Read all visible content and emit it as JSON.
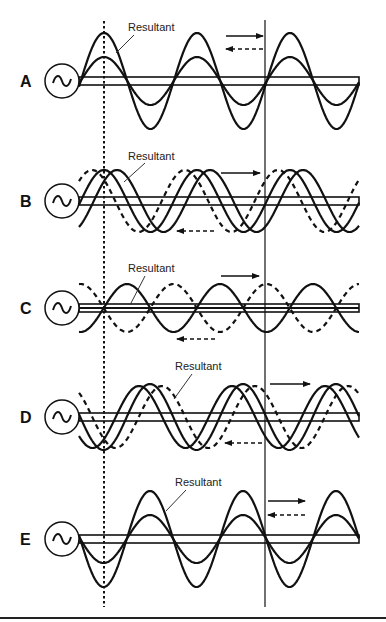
{
  "figure": {
    "width": 386,
    "height": 622,
    "line_color": "#111111",
    "background": "#ffffff",
    "reference_lines": {
      "dotted": {
        "x": 104,
        "y1": 21,
        "y2": 607
      },
      "solid": {
        "x": 265,
        "y1": 20,
        "y2": 607
      }
    },
    "bottom_rule": {
      "y": 618,
      "x1": 0,
      "x2": 386
    },
    "wavelength": 93,
    "conductor": {
      "x_start": 79,
      "x_end": 359
    },
    "panels": [
      {
        "id": "A",
        "letter": "A",
        "center_y": 81,
        "source": {
          "cx": 62,
          "r": 17
        },
        "bars": [
          77,
          85
        ],
        "resultant_label": {
          "text": "Resultant",
          "x": 128,
          "y": 31,
          "leader": [
            134,
            35,
            116,
            53
          ]
        },
        "waves": [
          {
            "role": "resultant",
            "style": "solid",
            "amplitude": 48,
            "phase_peak_x": 104,
            "x_start": 79,
            "x_end": 359,
            "invert": false
          },
          {
            "role": "component",
            "style": "solid",
            "amplitude": 24,
            "phase_peak_x": 104,
            "x_start": 79,
            "x_end": 359,
            "invert": false
          }
        ],
        "arrows": [
          {
            "direction": "right",
            "style": "solid",
            "x1": 226,
            "x2": 263,
            "y": 36
          },
          {
            "direction": "left",
            "style": "dashed",
            "x1": 263,
            "x2": 226,
            "y": 49
          }
        ]
      },
      {
        "id": "B",
        "letter": "B",
        "center_y": 201,
        "source": {
          "cx": 62,
          "r": 17
        },
        "bars": [
          197,
          205
        ],
        "resultant_label": {
          "text": "Resultant",
          "x": 128,
          "y": 160,
          "leader": [
            145,
            163,
            124,
            182
          ]
        },
        "waves": [
          {
            "role": "resultant",
            "style": "solid",
            "amplitude": 31,
            "phase_peak_x": 104,
            "x_start": 79,
            "x_end": 359,
            "invert": false
          },
          {
            "role": "forward",
            "style": "solid",
            "amplitude": 31,
            "phase_peak_x": 117,
            "x_start": 79,
            "x_end": 359,
            "invert": false
          },
          {
            "role": "reflected",
            "style": "dashed",
            "amplitude": 31,
            "phase_peak_x": 92,
            "x_start": 79,
            "x_end": 359,
            "invert": false
          }
        ],
        "arrows": [
          {
            "direction": "right",
            "style": "solid",
            "x1": 221,
            "x2": 260,
            "y": 173
          },
          {
            "direction": "left",
            "style": "dashed",
            "x1": 214,
            "x2": 177,
            "y": 231
          }
        ]
      },
      {
        "id": "C",
        "letter": "C",
        "center_y": 308,
        "source": {
          "cx": 62,
          "r": 17
        },
        "bars": [
          304,
          312
        ],
        "resultant_label": {
          "text": "Resultant",
          "x": 128,
          "y": 272,
          "leader": [
            145,
            276,
            130,
            305
          ]
        },
        "waves": [
          {
            "role": "resultant",
            "style": "solid",
            "amplitude": 0,
            "phase_peak_x": 104,
            "x_start": 79,
            "x_end": 359,
            "invert": false
          },
          {
            "role": "forward",
            "style": "solid",
            "amplitude": 24,
            "phase_peak_x": 127,
            "x_start": 79,
            "x_end": 359,
            "invert": false
          },
          {
            "role": "reflected",
            "style": "dashed",
            "amplitude": 24,
            "phase_peak_x": 127,
            "x_start": 79,
            "x_end": 359,
            "invert": true
          }
        ],
        "arrows": [
          {
            "direction": "right",
            "style": "solid",
            "x1": 221,
            "x2": 259,
            "y": 276
          },
          {
            "direction": "left",
            "style": "dashed",
            "x1": 215,
            "x2": 177,
            "y": 339
          }
        ]
      },
      {
        "id": "D",
        "letter": "D",
        "center_y": 417,
        "source": {
          "cx": 62,
          "r": 17
        },
        "bars": [
          413,
          421
        ],
        "resultant_label": {
          "text": "Resultant",
          "x": 175,
          "y": 370,
          "leader": [
            192,
            374,
            174,
            399
          ]
        },
        "waves": [
          {
            "role": "resultant",
            "style": "solid",
            "amplitude": 33,
            "phase_peak_x": 150,
            "x_start": 79,
            "x_end": 359,
            "invert": false
          },
          {
            "role": "forward",
            "style": "solid",
            "amplitude": 31,
            "phase_peak_x": 139,
            "x_start": 79,
            "x_end": 359,
            "invert": false
          },
          {
            "role": "reflected",
            "style": "dashed",
            "amplitude": 31,
            "phase_peak_x": 162,
            "x_start": 79,
            "x_end": 359,
            "invert": false
          }
        ],
        "arrows": [
          {
            "direction": "right",
            "style": "solid",
            "x1": 270,
            "x2": 310,
            "y": 384
          },
          {
            "direction": "left",
            "style": "dashed",
            "x1": 262,
            "x2": 225,
            "y": 443
          }
        ]
      },
      {
        "id": "E",
        "letter": "E",
        "center_y": 539,
        "source": {
          "cx": 62,
          "r": 17
        },
        "bars": [
          535,
          543
        ],
        "resultant_label": {
          "text": "Resultant",
          "x": 175,
          "y": 486,
          "leader": [
            186,
            490,
            166,
            511
          ]
        },
        "waves": [
          {
            "role": "resultant",
            "style": "solid",
            "amplitude": 48,
            "phase_peak_x": 150,
            "x_start": 79,
            "x_end": 359,
            "invert": false
          },
          {
            "role": "component",
            "style": "solid",
            "amplitude": 24,
            "phase_peak_x": 150,
            "x_start": 79,
            "x_end": 359,
            "invert": false
          }
        ],
        "arrows": [
          {
            "direction": "right",
            "style": "solid",
            "x1": 268,
            "x2": 305,
            "y": 501
          },
          {
            "direction": "left",
            "style": "dashed",
            "x1": 305,
            "x2": 268,
            "y": 515
          }
        ]
      }
    ]
  }
}
